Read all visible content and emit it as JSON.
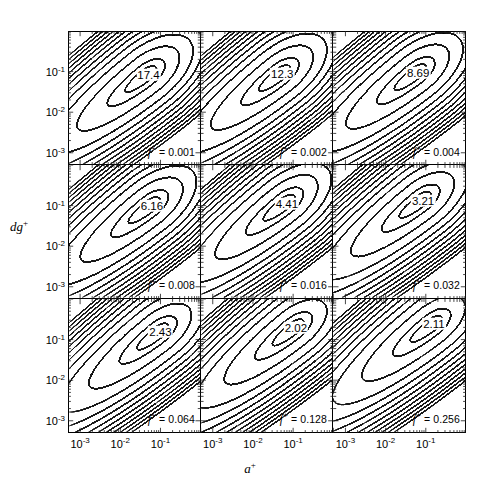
{
  "figure": {
    "kind": "contour-panel-grid",
    "rows": 3,
    "cols": 3,
    "x_axis_title": "a",
    "x_axis_title_sup": "+",
    "y_axis_title": "dg",
    "y_axis_title_sup": "+",
    "x_tick_labels": [
      "10",
      "10",
      "10"
    ],
    "x_tick_exponents": [
      "-3",
      "-2",
      "-1"
    ],
    "y_tick_labels": [
      "10",
      "10",
      "10"
    ],
    "y_tick_exponents": [
      "-1",
      "-2",
      "-3"
    ],
    "line_color": "#1a1a1a",
    "background": "#ffffff"
  },
  "chart_data": {
    "type": "contour",
    "title": "",
    "xlabel": "a+",
    "ylabel": "dg+",
    "xscale": "log",
    "yscale": "log",
    "xlim": [
      0.0005,
      1.0
    ],
    "ylim": [
      0.0005,
      1.0
    ],
    "grid": false,
    "legend": "none",
    "panel_parameter_name": "f+",
    "panels": [
      {
        "row": 0,
        "col": 0,
        "f_star": "0.001",
        "peak_label": "17.4",
        "peak_value": 17.4,
        "peak_x": 0.045,
        "peak_y": 0.085
      },
      {
        "row": 0,
        "col": 1,
        "f_star": "0.002",
        "peak_label": "12.3",
        "peak_value": 12.3,
        "peak_x": 0.05,
        "peak_y": 0.09
      },
      {
        "row": 0,
        "col": 2,
        "f_star": "0.004",
        "peak_label": "8.69",
        "peak_value": 8.69,
        "peak_x": 0.06,
        "peak_y": 0.095
      },
      {
        "row": 1,
        "col": 0,
        "f_star": "0.008",
        "peak_label": "6.16",
        "peak_value": 6.16,
        "peak_x": 0.055,
        "peak_y": 0.095
      },
      {
        "row": 1,
        "col": 1,
        "f_star": "0.016",
        "peak_label": "4.41",
        "peak_value": 4.41,
        "peak_x": 0.065,
        "peak_y": 0.11
      },
      {
        "row": 1,
        "col": 2,
        "f_star": "0.032",
        "peak_label": "3.21",
        "peak_value": 3.21,
        "peak_x": 0.08,
        "peak_y": 0.13
      },
      {
        "row": 2,
        "col": 0,
        "f_star": "0.064",
        "peak_label": "2.43",
        "peak_value": 2.43,
        "peak_x": 0.09,
        "peak_y": 0.15
      },
      {
        "row": 2,
        "col": 1,
        "f_star": "0.128",
        "peak_label": "2.02",
        "peak_value": 2.02,
        "peak_x": 0.11,
        "peak_y": 0.19
      },
      {
        "row": 2,
        "col": 2,
        "f_star": "0.256",
        "peak_label": "2.11",
        "peak_value": 2.11,
        "peak_x": 0.15,
        "peak_y": 0.23
      }
    ]
  }
}
